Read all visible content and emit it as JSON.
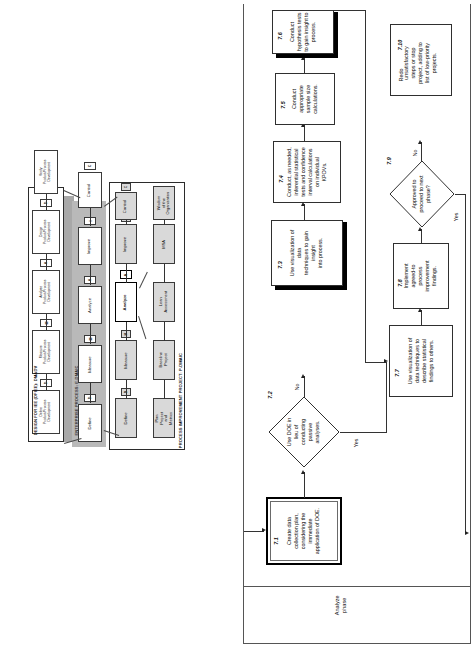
{
  "diagram": {
    "title_flow": "IEE Analyze Phase Flowchart",
    "left_panels": {
      "dfiee": {
        "caption": "DESIGN FOR IEE (DFIEE): DMADV",
        "steps": [
          {
            "tag": "D",
            "label": "Define\nProduct/Process\nDevelopment"
          },
          {
            "tag": "M",
            "label": "Measure\nProduct/Process\nDevelopment"
          },
          {
            "tag": "A",
            "label": "Analyze\nProduct/Process\nDevelopment"
          },
          {
            "tag": "D",
            "label": "Design\nProduct/Process\nDevelopment"
          },
          {
            "tag": "V",
            "label": "Verify\nProduct/Process\nDevelopment"
          }
        ]
      },
      "enterprise": {
        "caption": "ENTERPRISE PROCESS: E-DMAIC",
        "steps": [
          {
            "tag": "D",
            "label": "Define"
          },
          {
            "tag": "M",
            "label": "Measure"
          },
          {
            "tag": "A",
            "label": "Analyze"
          },
          {
            "tag": "I",
            "label": "Improve"
          },
          {
            "tag": "C",
            "label": "Control"
          }
        ]
      },
      "project": {
        "caption": "PROCESS IMPROVEMENT PROJECT: P-DMAIC",
        "steps": [
          {
            "tag": "D",
            "label": "Define",
            "highlight": false
          },
          {
            "tag": "M",
            "label": "Measure",
            "highlight": false
          },
          {
            "tag": "A",
            "label": "Analyze",
            "highlight": true
          },
          {
            "tag": "I",
            "label": "Improve",
            "highlight": false
          },
          {
            "tag": "C",
            "label": "Control",
            "highlight": false
          }
        ],
        "substeps": [
          {
            "label": "Plan Project\nand Metrics"
          },
          {
            "label": "Baseline\nProject"
          },
          {
            "label": "Lean\nAssessment"
          },
          {
            "label": "MSA"
          },
          {
            "label": "Wisdom\nof the\nOrganization"
          }
        ]
      }
    },
    "swimlane": {
      "label": "Analyze\nphase"
    },
    "flow_nodes": [
      {
        "id": "7.1",
        "type": "process",
        "emphasis": "thick",
        "text": "Create data\ncollection plan,\nconsidering the\nimmediate\napplication of DOE."
      },
      {
        "id": "7.2",
        "type": "decision",
        "text": "Use DOE in\nlieu of\nconducting\npassive\nanalyses."
      },
      {
        "id": "7.3",
        "type": "process",
        "emphasis": "shadow",
        "text": "Use visualization of data\ntechniques to gain insight\ninto process."
      },
      {
        "id": "7.4",
        "type": "process",
        "text": "Conduct, as needed,\ninferential statistical\ntests and confidence\ninterval calculations\non individual\nKPOVs."
      },
      {
        "id": "7.5",
        "type": "process",
        "text": "Conduct\nappropriate\nsample size\ncalculations."
      },
      {
        "id": "7.6",
        "type": "process",
        "emphasis": "shadow",
        "text": "Conduct\nhypothesis tests\nto gain insight to\nprocess."
      },
      {
        "id": "7.7",
        "type": "process",
        "text": "Use visualization of\ndata techniques to\ndescribe statistical\nfindings to others."
      },
      {
        "id": "7.8",
        "type": "process",
        "text": "Implement\nagreed-to\nprocess\nimprovement\nfindings."
      },
      {
        "id": "7.9",
        "type": "decision",
        "text": "Approved to\nproceed to next\nphase?"
      },
      {
        "id": "7.10",
        "type": "process",
        "prefix": "Redo",
        "text": "unsatisfactory\nsteps or stop\nproject, adding to\nlist of low-priority\nprojects."
      }
    ],
    "edge_labels": {
      "d72_no": "No",
      "d72_yes": "Yes",
      "d79_no": "No",
      "d79_yes": "Yes"
    },
    "colors": {
      "line": "#333333",
      "box_border": "#2f2f2f",
      "grey_fill": "#d9d9d9",
      "slab": "#b9b9b9",
      "paper": "#ffffff"
    }
  }
}
